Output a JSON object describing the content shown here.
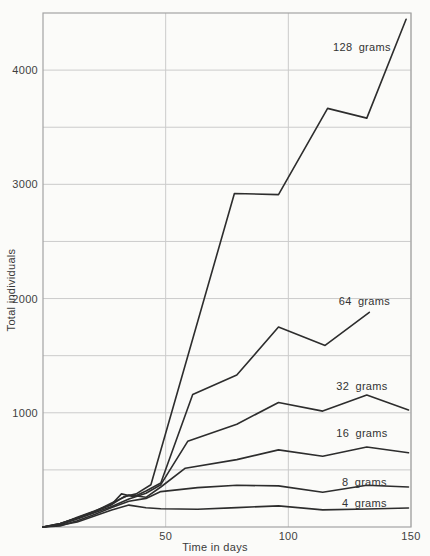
{
  "chart_data": {
    "type": "line",
    "title": "",
    "xlabel": "Time in days",
    "ylabel": "Total individuals",
    "xlim": [
      0,
      150
    ],
    "ylim": [
      0,
      4500
    ],
    "xticks": [
      50,
      100,
      150
    ],
    "yticks_labeled": [
      1000,
      2000,
      3000,
      4000
    ],
    "xgrid_interval": 50,
    "ygrid_interval": 500,
    "grid": true,
    "legend": "inline-labels",
    "series": [
      {
        "name": "128 grams",
        "label_at": {
          "x": 130,
          "y": 4200
        },
        "x": [
          0,
          7,
          14,
          21,
          28,
          33,
          38,
          44,
          78,
          96,
          116,
          132,
          148
        ],
        "y": [
          0,
          30,
          80,
          135,
          195,
          265,
          290,
          370,
          2920,
          2910,
          3665,
          3580,
          4445
        ]
      },
      {
        "name": "64 grams",
        "label_at": {
          "x": 131,
          "y": 1980
        },
        "x": [
          0,
          7,
          14,
          21,
          28,
          32,
          37,
          42,
          48,
          61,
          79,
          96,
          115,
          133
        ],
        "y": [
          0,
          25,
          85,
          140,
          200,
          290,
          265,
          315,
          385,
          1160,
          1330,
          1750,
          1590,
          1880
        ]
      },
      {
        "name": "32 grams",
        "label_at": {
          "x": 130,
          "y": 1235
        },
        "x": [
          0,
          7,
          14,
          21,
          28,
          35,
          42,
          48,
          59,
          79,
          96,
          114,
          132,
          149
        ],
        "y": [
          0,
          20,
          70,
          125,
          180,
          245,
          295,
          370,
          750,
          900,
          1090,
          1015,
          1155,
          1025
        ]
      },
      {
        "name": "16 grams",
        "label_at": {
          "x": 130,
          "y": 820
        },
        "x": [
          0,
          7,
          14,
          21,
          28,
          35,
          42,
          48,
          58,
          79,
          96,
          114,
          132,
          149
        ],
        "y": [
          0,
          30,
          80,
          135,
          210,
          280,
          260,
          350,
          515,
          590,
          675,
          620,
          700,
          650
        ]
      },
      {
        "name": "8 grams",
        "label_at": {
          "x": 131,
          "y": 390
        },
        "x": [
          0,
          7,
          14,
          21,
          28,
          35,
          42,
          48,
          63,
          79,
          96,
          114,
          132,
          149
        ],
        "y": [
          0,
          10,
          55,
          110,
          170,
          225,
          250,
          310,
          345,
          365,
          360,
          305,
          365,
          350
        ]
      },
      {
        "name": "4 grams",
        "label_at": {
          "x": 131,
          "y": 210
        },
        "x": [
          0,
          7,
          14,
          21,
          28,
          35,
          42,
          48,
          63,
          79,
          96,
          114,
          132,
          149
        ],
        "y": [
          0,
          15,
          45,
          95,
          150,
          192,
          168,
          160,
          155,
          170,
          185,
          150,
          158,
          166
        ]
      }
    ],
    "colors": {
      "line": "#2d2d2d",
      "grid": "#cbcbcb",
      "frame": "#a3a3a3",
      "text": "#3a3a3a",
      "background": "#fbfbf9"
    }
  }
}
